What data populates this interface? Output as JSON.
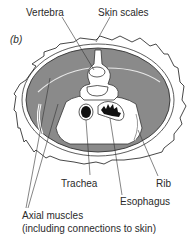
{
  "figure": {
    "panel_label": "(b)",
    "labels": {
      "vertebra": "Vertebra",
      "skin_scales": "Skin scales",
      "trachea": "Trachea",
      "rib": "Rib",
      "esophagus": "Esophagus",
      "axial_muscles_line1": "Axial muscles",
      "axial_muscles_line2": "(including connections to skin)"
    },
    "colors": {
      "muscle": "#8a8a8a",
      "outline": "#333333",
      "background": "#ffffff"
    }
  }
}
